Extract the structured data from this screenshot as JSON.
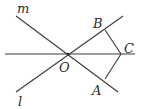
{
  "diagram": {
    "title": "",
    "labels": {
      "m": "m",
      "l": "l",
      "O": "O",
      "A": "A",
      "B": "B",
      "C": "C"
    },
    "points": {
      "O": [
        68,
        54
      ],
      "A": [
        105,
        79
      ],
      "B": [
        105,
        30
      ],
      "C": [
        121,
        54
      ]
    },
    "lines": [
      {
        "name": "line-m",
        "label": "m",
        "from": [
          16,
          16
        ],
        "to": [
          118,
          92
        ]
      },
      {
        "name": "line-l",
        "label": "l",
        "from": [
          16,
          92
        ],
        "to": [
          123,
          16
        ]
      },
      {
        "name": "line-OC",
        "label": "",
        "from": [
          5,
          54
        ],
        "to": [
          135,
          54
        ]
      }
    ],
    "segments": [
      {
        "name": "segment-BC",
        "from": "B",
        "to": "C"
      },
      {
        "name": "segment-AC",
        "from": "A",
        "to": "C"
      }
    ],
    "colors": {
      "stroke": "#3a3a3a",
      "text": "#2a2a2a",
      "background": "#ffffff"
    }
  }
}
